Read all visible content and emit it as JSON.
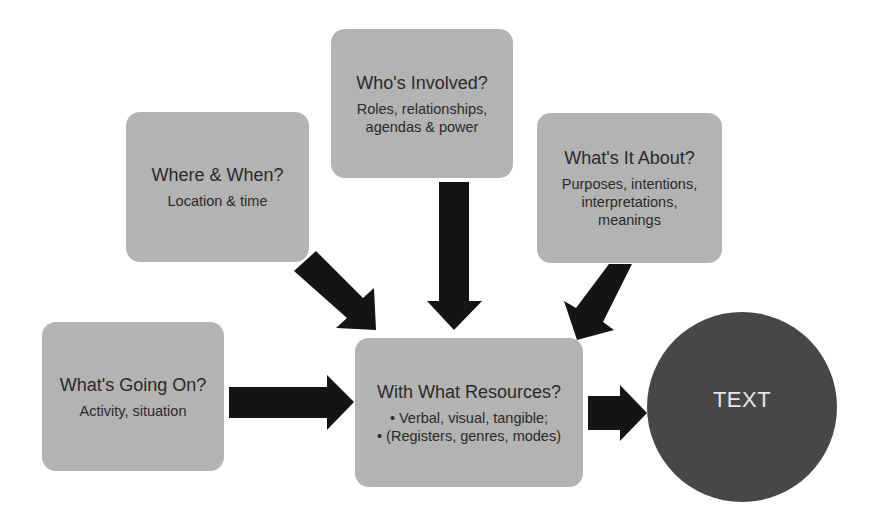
{
  "diagram": {
    "nodes": [
      {
        "id": "who",
        "title": "Who's Involved?",
        "lines": [
          "Roles, relationships,",
          "agendas & power"
        ]
      },
      {
        "id": "where",
        "title": "Where & When?",
        "lines": [
          "Location & time"
        ]
      },
      {
        "id": "about",
        "title": "What's It About?",
        "lines": [
          "Purposes, intentions,",
          "interpretations,",
          "meanings"
        ]
      },
      {
        "id": "going",
        "title": "What's Going On?",
        "lines": [
          "Activity, situation"
        ]
      },
      {
        "id": "resources",
        "title": "With What Resources?",
        "lines": [
          "• Verbal, visual, tangible;",
          "• (Registers, genres, modes)"
        ]
      },
      {
        "id": "text",
        "title": "TEXT",
        "lines": []
      }
    ],
    "edges": [
      {
        "from": "where",
        "to": "resources"
      },
      {
        "from": "who",
        "to": "resources"
      },
      {
        "from": "about",
        "to": "resources"
      },
      {
        "from": "going",
        "to": "resources"
      },
      {
        "from": "resources",
        "to": "text"
      }
    ],
    "colors": {
      "box_fill": "#b3b3b3",
      "arrow_fill": "#141414",
      "circle_fill": "#474747",
      "circle_text": "#e6e6e6"
    }
  }
}
